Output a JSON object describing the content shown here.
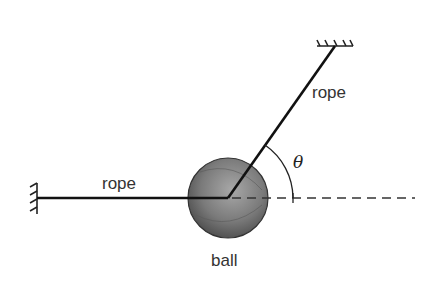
{
  "diagram": {
    "labels": {
      "left_rope": "rope",
      "upper_rope": "rope",
      "ball": "ball",
      "angle": "θ"
    },
    "colors": {
      "line": "#111111",
      "ball_light": "#9a9a9a",
      "ball_dark": "#4a4a4a",
      "text": "#333333"
    },
    "geometry": {
      "ball_center": [
        228,
        198
      ],
      "ball_radius": 40,
      "left_anchor": [
        37,
        198
      ],
      "upper_anchor": [
        335,
        46
      ],
      "dashed_line_end": [
        415,
        198
      ]
    }
  }
}
